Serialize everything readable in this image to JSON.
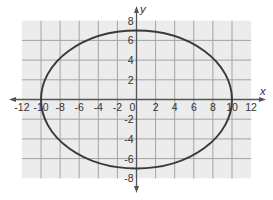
{
  "chart_data": {
    "type": "line",
    "subtype": "ellipse",
    "title": "",
    "xlabel": "x",
    "ylabel": "y",
    "xlim": [
      -12,
      12
    ],
    "ylim": [
      -8,
      8
    ],
    "grid": true,
    "grid_step": 2,
    "x_ticks": [
      "-12",
      "-10",
      "-8",
      "-6",
      "-4",
      "-2",
      "0",
      "2",
      "4",
      "6",
      "8",
      "10",
      "12"
    ],
    "y_ticks": [
      "8",
      "6",
      "4",
      "2",
      "-2",
      "-4",
      "-6",
      "-8"
    ],
    "series": [
      {
        "name": "ellipse",
        "equation": "x^2/100 + y^2/49 = 1",
        "center": [
          0,
          0
        ],
        "semi_major_x": 10,
        "semi_minor_y": 7,
        "key_points": [
          [
            10,
            0
          ],
          [
            0,
            7
          ],
          [
            -10,
            0
          ],
          [
            0,
            -7
          ]
        ]
      }
    ],
    "legend": null,
    "colors": {
      "background": "#ffffff",
      "plot_area": "#ececec",
      "grid_line": "#a4a4a4",
      "axis": "#555555",
      "curve": "#3a3a3a",
      "text": "#333333"
    }
  }
}
